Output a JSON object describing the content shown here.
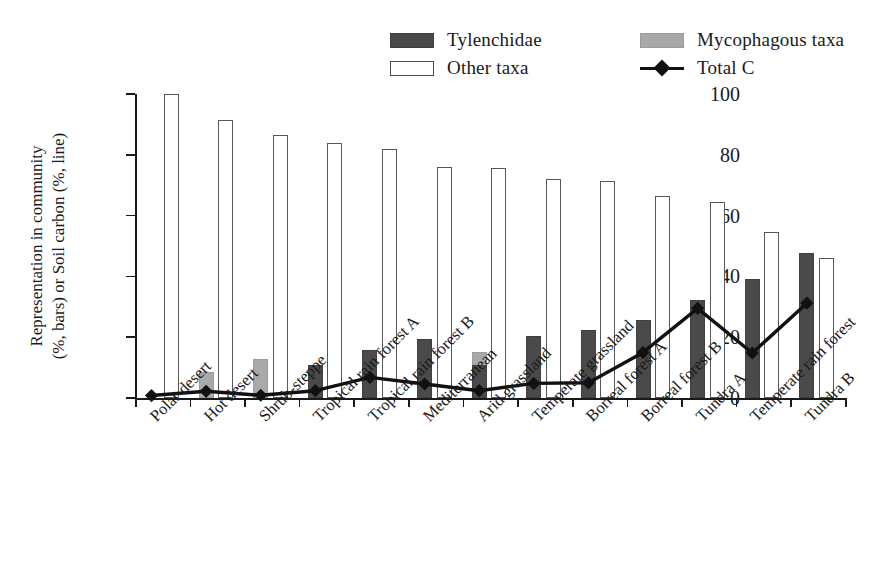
{
  "chart_data": {
    "type": "bar",
    "title": "",
    "xlabel": "",
    "ylabel": "Representation in community (%, bars) or Soil carbon (%, line)",
    "ylabel_line1": "Representation in community",
    "ylabel_line2": "(%, bars) or Soil carbon (%, line)",
    "ylim": [
      0,
      100
    ],
    "yticks": [
      0,
      20,
      40,
      60,
      80,
      100
    ],
    "grid": false,
    "legend_position": "top-center",
    "categories": [
      "Polar desert",
      "Hot desert",
      "Shrub-steppe",
      "Tropical rain forest A",
      "Tropical rain forest B",
      "Mediterranean",
      "Arid grassland",
      "Temperate grassland",
      "Borreal forest A",
      "Borreal forest B",
      "Tundra A",
      "Temperate rain forest",
      "Tundra B"
    ],
    "series": [
      {
        "name": "Tylenchidae",
        "kind": "bar",
        "color": "#4a4a4a",
        "values": [
          0,
          0,
          0,
          10.8,
          15.8,
          19.4,
          11.0,
          20.5,
          22.5,
          25.5,
          32.2,
          39.2,
          47.8
        ]
      },
      {
        "name": "Mycophagous taxa",
        "kind": "bar",
        "color": "#a9a9a9",
        "values": [
          0,
          8.5,
          12.7,
          6.2,
          2.8,
          4.0,
          15.3,
          5.0,
          4.8,
          10.0,
          4.5,
          7.8,
          8.4
        ]
      },
      {
        "name": "Other taxa",
        "kind": "bar",
        "color": "#ffffff",
        "values": [
          100.0,
          91.5,
          86.5,
          84.0,
          82.0,
          76.0,
          75.5,
          72.0,
          71.5,
          66.5,
          64.5,
          54.5,
          46.0
        ]
      },
      {
        "name": "Total C",
        "kind": "line",
        "color": "#111111",
        "marker": "diamond",
        "values": [
          0.8,
          2.2,
          0.9,
          2.4,
          6.8,
          4.6,
          2.4,
          4.8,
          5.0,
          15.0,
          29.5,
          14.8,
          31.2
        ]
      }
    ]
  },
  "legend": {
    "items": [
      {
        "label": "Tylenchidae",
        "swatch": "dark-square-swatch"
      },
      {
        "label": "Mycophagous taxa",
        "swatch": "gray-square-swatch"
      },
      {
        "label": "Other taxa",
        "swatch": "white-square-swatch"
      },
      {
        "label": "Total C",
        "swatch": "line-diamond-swatch"
      }
    ]
  }
}
